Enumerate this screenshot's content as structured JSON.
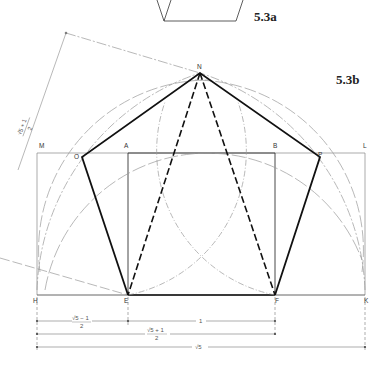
{
  "figures": {
    "fig_a_label": "5.3a",
    "fig_b_label": "5.3b"
  },
  "points": {
    "N": "N",
    "M": "M",
    "L": "L",
    "O": "O",
    "P": "P",
    "A": "A",
    "B": "B",
    "H": "H",
    "E": "E",
    "F": "F",
    "K": "K"
  },
  "dimensions": {
    "HE": "√5 − 1",
    "HE_den": "2",
    "EF": "1",
    "HF": "√5 + 1",
    "HF_den": "2",
    "HK": "√5",
    "rotated": "√5 + 1",
    "rotated_den": "2"
  },
  "colors": {
    "thick": "#111111",
    "thin": "#777777",
    "construction": "#999999"
  }
}
